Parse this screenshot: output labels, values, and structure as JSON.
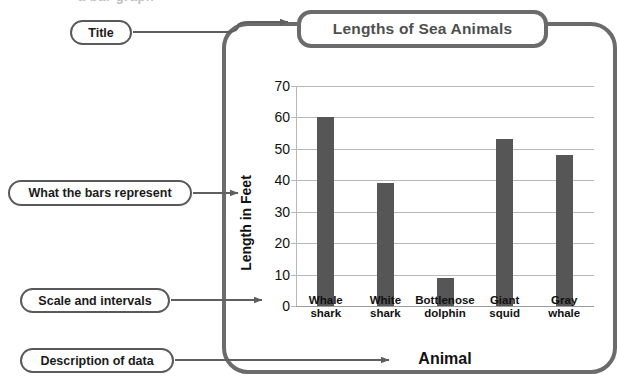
{
  "page": {
    "top_cutoff_text": "a bar graph",
    "frame_label": "graph-frame"
  },
  "callouts": [
    {
      "id": "title",
      "label": "Title",
      "points_to": "chart-title"
    },
    {
      "id": "bars",
      "label": "What the bars represent",
      "points_to": "y-axis-label"
    },
    {
      "id": "scale",
      "label": "Scale and intervals",
      "points_to": "y-axis-ticks"
    },
    {
      "id": "description",
      "label": "Description of data",
      "points_to": "x-axis-title"
    }
  ],
  "colors": {
    "bar_fill": "#565656",
    "frame_stroke": "#6b6b6b",
    "callout_stroke": "#5a5a5a",
    "gridline": "#b9b9b9",
    "title_text": "#4f4f4f"
  },
  "chart_data": {
    "type": "bar",
    "title": "Lengths of Sea Animals",
    "xlabel": "Animal",
    "ylabel": "Length in Feet",
    "categories": [
      "Whale shark",
      "White shark",
      "Bottlenose dolphin",
      "Giant squid",
      "Gray whale"
    ],
    "category_lines": [
      [
        "Whale",
        "shark"
      ],
      [
        "White",
        "shark"
      ],
      [
        "Bottlenose",
        "dolphin"
      ],
      [
        "Giant",
        "squid"
      ],
      [
        "Gray",
        "whale"
      ]
    ],
    "values": [
      60,
      39,
      9,
      53,
      48
    ],
    "ylim": [
      0,
      70
    ],
    "ytick_values": [
      0,
      10,
      20,
      30,
      40,
      50,
      60,
      70
    ],
    "ytick_labels": [
      "0",
      "10",
      "20",
      "30",
      "40",
      "50",
      "60",
      "70"
    ],
    "tick_interval": 10,
    "grid": true,
    "legend": false
  }
}
